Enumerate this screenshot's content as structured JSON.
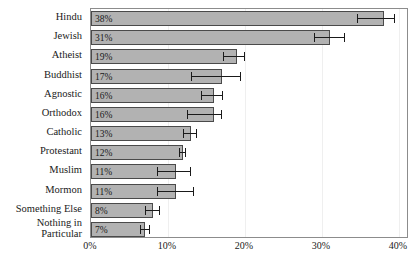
{
  "chart_data": {
    "type": "bar",
    "orientation": "horizontal",
    "title": "",
    "xlabel": "",
    "ylabel": "",
    "xlim": [
      0,
      41.3
    ],
    "grid": true,
    "legend": null,
    "xticks": [
      "0%",
      "10%",
      "20%",
      "30%",
      "40%"
    ],
    "xtick_values": [
      0,
      10,
      20,
      30,
      40
    ],
    "categories": [
      "Hindu",
      "Jewish",
      "Atheist",
      "Buddhist",
      "Agnostic",
      "Orthodox",
      "Catholic",
      "Protestant",
      "Muslim",
      "Mormon",
      "Something Else",
      "Nothing in Particular"
    ],
    "values": [
      38,
      31,
      19,
      17,
      16,
      16,
      13,
      12,
      11,
      11,
      8,
      7
    ],
    "value_labels": [
      "38%",
      "31%",
      "19%",
      "17%",
      "16%",
      "16%",
      "13%",
      "12%",
      "11%",
      "11%",
      "8%",
      "7%"
    ],
    "error_low": [
      34.5,
      29.0,
      17.2,
      13.0,
      14.3,
      12.5,
      11.9,
      11.4,
      8.6,
      8.6,
      7.0,
      6.4
    ],
    "error_high": [
      39.5,
      33.0,
      20.0,
      19.5,
      17.2,
      17.0,
      13.8,
      12.4,
      13.0,
      13.4,
      8.9,
      7.7
    ],
    "bar_color": "#b2b2b2",
    "bar_edge_color": "#4a4a4a",
    "error_color": "#1a1a1a"
  }
}
